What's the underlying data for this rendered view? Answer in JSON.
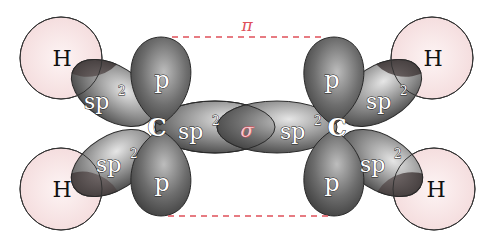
{
  "diagram": {
    "colors": {
      "pi_bond": "#e0505a",
      "sigma_label": "#e05a68",
      "hydrogen_fill": "#f8e4e4",
      "orbital_dark": "#3a3a3a",
      "orbital_light": "#d8d8d8",
      "outline": "#2a2a2a"
    },
    "labels": {
      "pi": "π",
      "sigma": "σ",
      "carbon_left": "C",
      "carbon_right": "C",
      "h_top_left": "H",
      "h_bottom_left": "H",
      "h_top_right": "H",
      "h_bottom_right": "H",
      "p_top_left": "p",
      "p_bottom_left": "p",
      "p_top_right": "p",
      "p_bottom_right": "p",
      "sp2_base": "sp",
      "sp2_sup": "2"
    },
    "atoms": [
      {
        "id": "C1",
        "label": "C",
        "x": 157,
        "y": 127
      },
      {
        "id": "C2",
        "label": "C",
        "x": 337,
        "y": 127
      },
      {
        "id": "H1",
        "label": "H",
        "x": 61,
        "y": 58
      },
      {
        "id": "H2",
        "label": "H",
        "x": 61,
        "y": 189
      },
      {
        "id": "H3",
        "label": "H",
        "x": 432,
        "y": 58
      },
      {
        "id": "H4",
        "label": "H",
        "x": 434,
        "y": 189
      }
    ],
    "bonds": [
      {
        "type": "sigma",
        "between": [
          "C1",
          "C2"
        ],
        "label": "σ"
      },
      {
        "type": "pi",
        "between": [
          "C1",
          "C2"
        ],
        "label": "π",
        "style": "dashed"
      }
    ]
  }
}
